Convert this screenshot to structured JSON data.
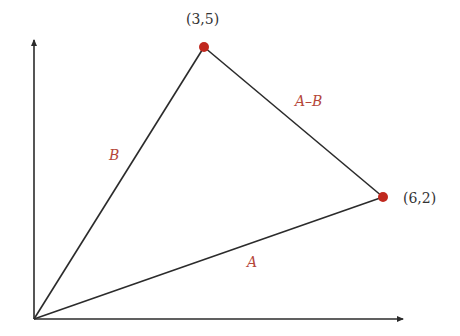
{
  "diagram": {
    "type": "vector-subtraction",
    "axes": {
      "x_axis": true,
      "y_axis": true
    },
    "points": [
      {
        "id": "tip-B",
        "label": "(3,5)",
        "x": 3,
        "y": 5
      },
      {
        "id": "tip-A",
        "label": "(6,2)",
        "x": 6,
        "y": 2
      }
    ],
    "vectors": [
      {
        "id": "A",
        "label": "A",
        "from": "origin",
        "to": "(6,2)"
      },
      {
        "id": "B",
        "label": "B",
        "from": "origin",
        "to": "(3,5)"
      },
      {
        "id": "A-B",
        "label": "A–B",
        "from": "(3,5)",
        "to": "(6,2)"
      }
    ],
    "colors": {
      "line": "#2b2b2b",
      "point": "#c0281e",
      "vector_label": "#b5473a",
      "point_label": "#333333"
    }
  }
}
